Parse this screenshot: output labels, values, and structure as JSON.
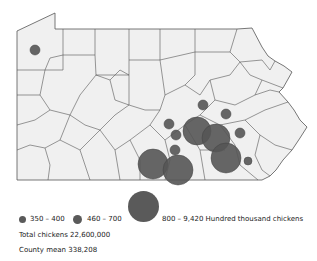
{
  "map": {
    "region": "Pennsylvania counties",
    "fill_color": "#f0f0f0",
    "border_color": "#555555",
    "bubble_color": "#555555",
    "bubbles": [
      {
        "cx": 35,
        "cy": 50,
        "r": 5,
        "class": "small"
      },
      {
        "cx": 203,
        "cy": 105,
        "r": 5,
        "class": "small"
      },
      {
        "cx": 226,
        "cy": 114,
        "r": 5,
        "class": "small"
      },
      {
        "cx": 169,
        "cy": 124,
        "r": 5,
        "class": "small"
      },
      {
        "cx": 176,
        "cy": 135,
        "r": 5,
        "class": "small"
      },
      {
        "cx": 240,
        "cy": 133,
        "r": 5,
        "class": "small"
      },
      {
        "cx": 175,
        "cy": 150,
        "r": 5,
        "class": "small"
      },
      {
        "cx": 248,
        "cy": 161,
        "r": 4,
        "class": "small"
      },
      {
        "cx": 197,
        "cy": 131,
        "r": 14,
        "class": "large"
      },
      {
        "cx": 216,
        "cy": 138,
        "r": 14,
        "class": "large"
      },
      {
        "cx": 226,
        "cy": 158,
        "r": 15,
        "class": "large"
      },
      {
        "cx": 153,
        "cy": 164,
        "r": 15,
        "class": "large"
      },
      {
        "cx": 178,
        "cy": 170,
        "r": 15,
        "class": "large"
      }
    ]
  },
  "legend": {
    "items": [
      {
        "label": "350 – 400",
        "size": "small"
      },
      {
        "label": "460 – 700",
        "size": "medium"
      },
      {
        "label": "800 – 9,420 Hundred thousand chickens",
        "size": "large"
      }
    ]
  },
  "notes": {
    "total": "Total chickens 22,600,000",
    "mean": "County mean 338,208"
  }
}
